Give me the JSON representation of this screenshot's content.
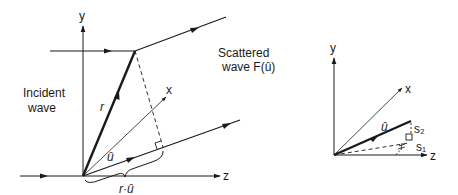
{
  "figure": {
    "main_diagram": {
      "axes": {
        "y_label": "y",
        "x_label": "x",
        "z_label": "z"
      },
      "labels": {
        "incident_line1": "Incident",
        "incident_line2": "wave",
        "scattered_line1": "Scattered",
        "scattered_line2": "wave F(û)",
        "r_vector": "r",
        "u_hat": "û",
        "projection": "r·û"
      }
    },
    "inset_diagram": {
      "axes": {
        "y_label": "y",
        "x_label": "x",
        "z_label": "z"
      },
      "labels": {
        "u_hat": "û",
        "s2": "s₂",
        "s1": "s₁"
      }
    },
    "colors": {
      "ink": "#1a1a1a",
      "background": "#ffffff"
    }
  }
}
